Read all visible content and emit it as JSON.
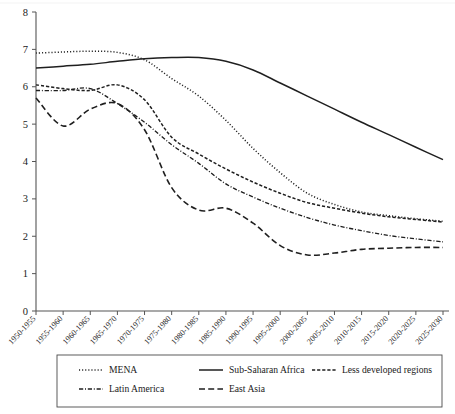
{
  "chart_data": {
    "type": "line",
    "title": "",
    "subtitle": "",
    "xlabel": "",
    "ylabel": "",
    "ylim": [
      0,
      8
    ],
    "ytick_labels": [
      "0",
      "1",
      "2",
      "3",
      "4",
      "5",
      "6",
      "7",
      "8"
    ],
    "ytick_values": [
      0,
      1,
      2,
      3,
      4,
      5,
      6,
      7,
      8
    ],
    "grid": false,
    "legend_position": "bottom",
    "categories": [
      "1950-1955",
      "1955-1960",
      "1960-1965",
      "1965-1970",
      "1970-1975",
      "1975-1980",
      "1980-1985",
      "1985-1990",
      "1990-1995",
      "1995-2000",
      "2000-2005",
      "2005-2010",
      "2010-2015",
      "2015-2020",
      "2020-2025",
      "2025-2030"
    ],
    "series": [
      {
        "name": "MENA",
        "style": "dotted",
        "values": [
          6.9,
          6.93,
          6.95,
          6.92,
          6.72,
          6.22,
          5.75,
          5.1,
          4.35,
          3.7,
          3.15,
          2.85,
          2.65,
          2.55,
          2.47,
          2.4
        ]
      },
      {
        "name": "Sub-Saharan Africa",
        "style": "solid",
        "values": [
          6.5,
          6.55,
          6.6,
          6.68,
          6.75,
          6.78,
          6.78,
          6.68,
          6.45,
          6.1,
          5.75,
          5.4,
          5.05,
          4.72,
          4.38,
          4.05
        ]
      },
      {
        "name": "Less developed regions",
        "style": "dashed",
        "values": [
          6.05,
          5.95,
          5.9,
          6.05,
          5.65,
          4.65,
          4.2,
          3.8,
          3.45,
          3.15,
          2.9,
          2.75,
          2.62,
          2.52,
          2.45,
          2.38
        ]
      },
      {
        "name": "Latin America",
        "style": "dashdot",
        "values": [
          5.9,
          5.9,
          5.95,
          5.55,
          5.05,
          4.45,
          3.95,
          3.4,
          3.05,
          2.75,
          2.5,
          2.3,
          2.15,
          2.02,
          1.93,
          1.85
        ]
      },
      {
        "name": "East Asia",
        "style": "longdash",
        "values": [
          5.7,
          4.95,
          5.4,
          5.55,
          4.85,
          3.3,
          2.7,
          2.75,
          2.35,
          1.75,
          1.5,
          1.55,
          1.65,
          1.68,
          1.7,
          1.7
        ]
      }
    ]
  },
  "legend": {
    "items": [
      {
        "label": "MENA",
        "style": "dotted"
      },
      {
        "label": "Sub-Saharan Africa",
        "style": "solid"
      },
      {
        "label": "Less developed regions",
        "style": "dashed"
      },
      {
        "label": "Latin America",
        "style": "dashdot"
      },
      {
        "label": "East Asia",
        "style": "longdash"
      }
    ]
  },
  "colors": {
    "ink": "#1f1f1f",
    "axis": "#555555",
    "background": "#ffffff"
  }
}
